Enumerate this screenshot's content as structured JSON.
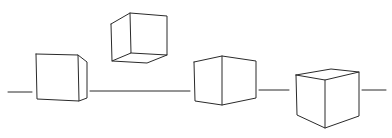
{
  "diagram": {
    "title": "",
    "stroke_color": "#2a2a2a",
    "background": "#ffffff",
    "horizon_segments": [
      {
        "x1": 8,
        "y1": 92,
        "x2": 32,
        "y2": 92
      },
      {
        "x1": 90,
        "y1": 91,
        "x2": 190,
        "y2": 91
      },
      {
        "x1": 259,
        "y1": 90,
        "x2": 289,
        "y2": 90
      },
      {
        "x1": 362,
        "y1": 90,
        "x2": 386,
        "y2": 90
      }
    ],
    "cubes": [
      {
        "name": "cube-1",
        "label": "",
        "polylines": [
          "36,54 78,55 79,101 37,99 36,54",
          "78,55 87,62 87,98 79,101"
        ]
      },
      {
        "name": "cube-2",
        "label": "",
        "polylines": [
          "111,24 130,13 167,16 167,55 147,63 112,61 111,24",
          "130,13 131,53 112,61",
          "131,53 167,55"
        ]
      },
      {
        "name": "cube-3",
        "label": "",
        "polylines": [
          "194,62 222,56 256,61 256,98 222,105 195,101 194,62",
          "222,56 222,105"
        ]
      },
      {
        "name": "cube-4",
        "label": "",
        "polylines": [
          "296,75 331,69 359,72 359,116 325,128 297,115 296,75",
          "296,75 325,80 359,72",
          "325,80 325,128"
        ]
      }
    ]
  }
}
